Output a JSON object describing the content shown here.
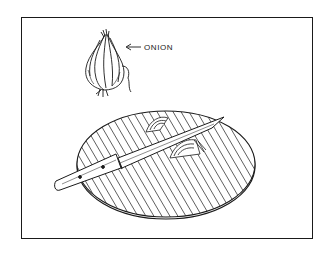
{
  "illustration": {
    "label": "ONION",
    "colors": {
      "ink": "#1a1a1a",
      "paper": "#ffffff"
    },
    "elements": [
      "onion",
      "cutting-board",
      "knife",
      "onion-slices",
      "label-arrow"
    ]
  }
}
